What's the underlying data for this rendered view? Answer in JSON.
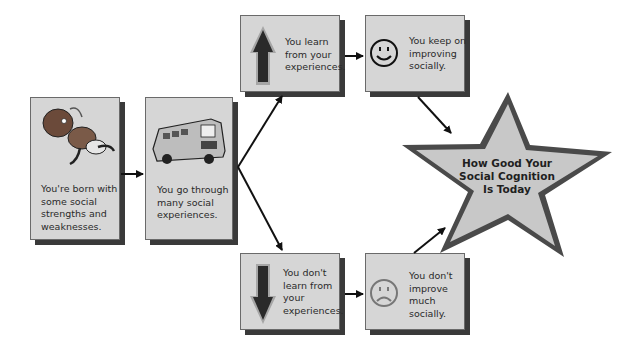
{
  "diagram": {
    "type": "flowchart",
    "nodes": [
      {
        "id": "born",
        "icon": "baby-icon",
        "text": "You're born with some social strengths and weaknesses."
      },
      {
        "id": "experiences",
        "icon": "bus-icon",
        "text": "You go through many social experiences."
      },
      {
        "id": "learn",
        "icon": "up-arrow-icon",
        "text": "You learn from your experiences."
      },
      {
        "id": "improve",
        "icon": "smiley-face-icon",
        "text": "You keep on improving socially."
      },
      {
        "id": "no-learn",
        "icon": "down-arrow-icon",
        "text": "You don't learn from your experiences."
      },
      {
        "id": "no-improve",
        "icon": "frowning-face-icon",
        "text": "You don't improve much socially."
      },
      {
        "id": "outcome",
        "shape": "star",
        "text": "How Good Your Social Cognition Is Today"
      }
    ],
    "edges": [
      {
        "from": "born",
        "to": "experiences"
      },
      {
        "from": "experiences",
        "to": "learn"
      },
      {
        "from": "experiences",
        "to": "no-learn"
      },
      {
        "from": "learn",
        "to": "improve"
      },
      {
        "from": "no-learn",
        "to": "no-improve"
      },
      {
        "from": "improve",
        "to": "outcome"
      },
      {
        "from": "no-improve",
        "to": "outcome"
      }
    ],
    "colors": {
      "box_fill": "#d6d6d6",
      "shadow": "#3a3a3a",
      "star_fill": "#c8c8c8",
      "star_border": "#4a4a4a"
    }
  },
  "labels": {
    "born": [
      "You're born with",
      "some social",
      "strengths and",
      "weaknesses."
    ],
    "experiences": [
      "You go through",
      "many social",
      "experiences."
    ],
    "learn": [
      "You learn",
      "from your",
      "experiences."
    ],
    "improve": [
      "You keep on",
      "improving",
      "socially."
    ],
    "no_learn": [
      "You don't",
      "learn from",
      "your",
      "experiences."
    ],
    "no_improve": [
      "You don't",
      "improve",
      "much",
      "socially."
    ],
    "outcome": [
      "How Good Your",
      "Social Cognition",
      "Is Today"
    ]
  }
}
